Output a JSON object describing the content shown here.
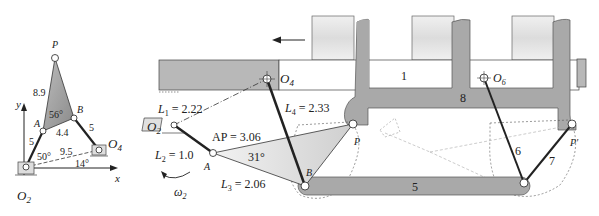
{
  "left_figure": {
    "labels": {
      "P": "P",
      "A": "A",
      "B": "B",
      "O2": "O",
      "O2_sub": "2",
      "O4": "O",
      "O4_sub": "4",
      "x_axis": "x",
      "y_axis": "y"
    },
    "dimensions": {
      "AP": "8.9",
      "AB": "4.4",
      "O2A": "5",
      "O4B": "5",
      "O2O4": "9.5",
      "angle_A": "56°",
      "angle_O2": "50°",
      "angle_O4": "14°"
    }
  },
  "right_figure": {
    "labels": {
      "O2": "O",
      "O2_sub": "2",
      "O4": "O",
      "O4_sub": "4",
      "O6": "O",
      "O6_sub": "6",
      "A": "A",
      "B": "B",
      "P": "P",
      "P_prime": "P′",
      "omega": "ω",
      "omega_sub": "2"
    },
    "dimensions": {
      "L1": "L",
      "L1_sub": "1",
      "L1_val": " = 2.22",
      "L2": "L",
      "L2_sub": "2",
      "L2_val": " = 1.0",
      "L3": "L",
      "L3_sub": "3",
      "L3_val": " = 2.06",
      "L4": "L",
      "L4_sub": "4",
      "L4_val": " = 2.33",
      "AP": "AP = 3.06",
      "angle": "31°"
    },
    "link_numbers": {
      "frame": "1",
      "link5": "5",
      "link6": "6",
      "link7": "7",
      "link8": "8"
    }
  }
}
